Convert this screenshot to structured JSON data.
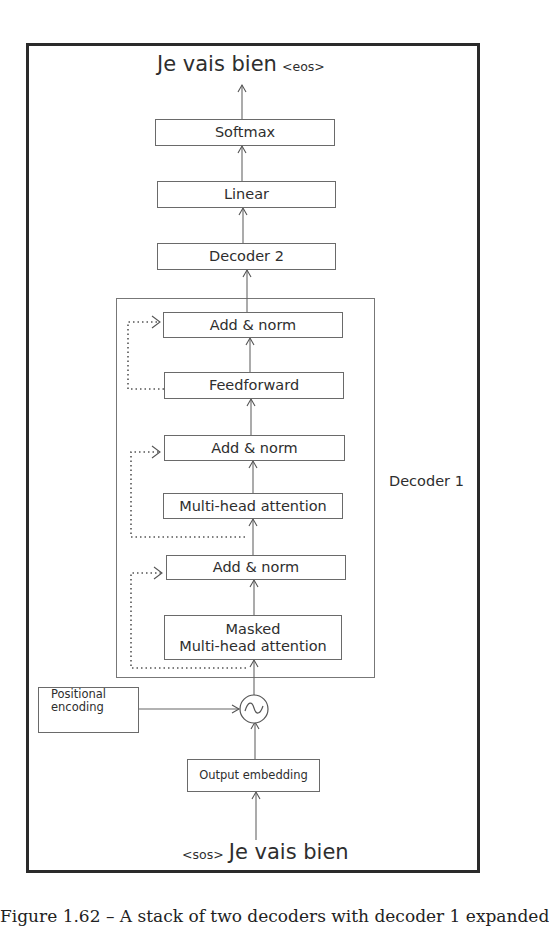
{
  "output_sentence": {
    "text": "Je vais bien",
    "token": "<eos>"
  },
  "input_sentence": {
    "token": "<sos>",
    "text": "Je vais bien"
  },
  "stack": {
    "softmax": "Softmax",
    "linear": "Linear",
    "decoder2": "Decoder 2"
  },
  "decoder1": {
    "label": "Decoder 1",
    "layers": {
      "add_norm_top": "Add & norm",
      "feedforward": "Feedforward",
      "add_norm_mid": "Add & norm",
      "multi_head_attention": "Multi-head attention",
      "add_norm_bottom": "Add & norm",
      "masked_line1": "Masked",
      "masked_line2": "Multi-head attention"
    }
  },
  "positional_encoding": {
    "line1": "Positional",
    "line2": "encoding"
  },
  "output_embedding": "Output embedding",
  "adder_symbol": "~",
  "caption": "Figure 1.62 – A stack of two decoders with decoder 1 expanded"
}
